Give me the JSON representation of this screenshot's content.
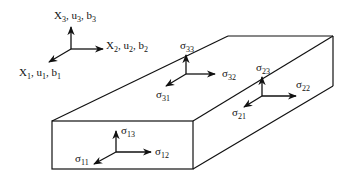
{
  "diagram": {
    "colors": {
      "stroke": "#111111",
      "background": "#ffffff"
    },
    "axes": {
      "x1": {
        "base": "X",
        "sub": "1",
        "rest": ", u",
        "rest_sub": "1",
        "tail": ", b",
        "tail_sub": "1"
      },
      "x2": {
        "base": "X",
        "sub": "2",
        "rest": ", u",
        "rest_sub": "2",
        "tail": ", b",
        "tail_sub": "2"
      },
      "x3": {
        "base": "X",
        "sub": "3",
        "rest": ", u",
        "rest_sub": "3",
        "tail": ", b",
        "tail_sub": "3"
      }
    },
    "stresses": {
      "s11": {
        "sym": "σ",
        "sub": "11"
      },
      "s12": {
        "sym": "σ",
        "sub": "12"
      },
      "s13": {
        "sym": "σ",
        "sub": "13"
      },
      "s21": {
        "sym": "σ",
        "sub": "21"
      },
      "s22": {
        "sym": "σ",
        "sub": "22"
      },
      "s23": {
        "sym": "σ",
        "sub": "23"
      },
      "s31": {
        "sym": "σ",
        "sub": "31"
      },
      "s32": {
        "sym": "σ",
        "sub": "32"
      },
      "s33": {
        "sym": "σ",
        "sub": "33"
      }
    }
  }
}
